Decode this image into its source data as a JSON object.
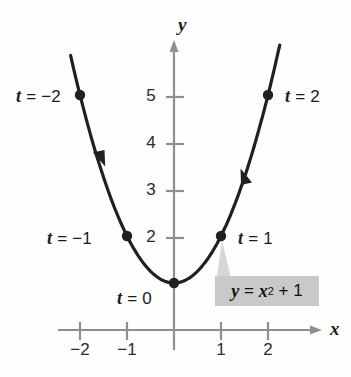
{
  "figure": {
    "background_color": "#fefefe",
    "curve_color": "#231f20",
    "axis_color": "#8a8a8a",
    "point_color": "#231f20",
    "equation_box_color": "#c9c9c9"
  },
  "axes": {
    "x_name": "x",
    "y_name": "y",
    "x_ticks": [
      "−2",
      "−1",
      "1",
      "2"
    ],
    "y_ticks": [
      "2",
      "3",
      "4",
      "5"
    ],
    "x_range": [
      -2.5,
      3.1
    ],
    "y_range": [
      -0.6,
      5.9
    ],
    "grid": false,
    "x_axis_arrow": true,
    "y_axis_arrow": true
  },
  "equation": {
    "lhs": "y",
    "equals": "=",
    "rhs_base": "x",
    "rhs_exponent": "2",
    "rhs_tail": "+ 1",
    "full_text": "y = x² + 1"
  },
  "point_labels": [
    {
      "name": "t-minus-2",
      "text_prefix": "t",
      "text_rest": " = −2",
      "x": 16,
      "y": 86
    },
    {
      "name": "t-minus-1",
      "text_prefix": "t",
      "text_rest": " = −1",
      "x": 47,
      "y": 228
    },
    {
      "name": "t-zero",
      "text_prefix": "t",
      "text_rest": " = 0",
      "x": 117,
      "y": 285
    },
    {
      "name": "t-one",
      "text_prefix": "t",
      "text_rest": " = 1",
      "x": 238,
      "y": 228
    },
    {
      "name": "t-two",
      "text_prefix": "t",
      "text_rest": " = 2",
      "x": 285,
      "y": 86
    }
  ],
  "chart_data": {
    "type": "line",
    "xlabel": "x",
    "ylabel": "y",
    "xlim": [
      -2.5,
      3.1
    ],
    "ylim": [
      -0.6,
      5.9
    ],
    "grid": false,
    "legend": "none",
    "function": "y = x^2 + 1",
    "parametrization": "x = t, y = t^2 + 1",
    "series": [
      {
        "name": "y = x^2 + 1",
        "x": [
          -2.2,
          -2.0,
          -1.5,
          -1.0,
          -0.5,
          0.0,
          0.5,
          1.0,
          1.5,
          2.0,
          2.25
        ],
        "y": [
          5.84,
          5.0,
          3.25,
          2.0,
          1.25,
          1.0,
          1.25,
          2.0,
          3.25,
          5.0,
          6.06
        ]
      }
    ],
    "marked_points": [
      {
        "t": -2,
        "x": -2,
        "y": 5,
        "label": "t = −2"
      },
      {
        "t": -1,
        "x": -1,
        "y": 2,
        "label": "t = −1"
      },
      {
        "t": 0,
        "x": 0,
        "y": 1,
        "label": "t = 0"
      },
      {
        "t": 1,
        "x": 1,
        "y": 2,
        "label": "t = 1"
      },
      {
        "t": 2,
        "x": 2,
        "y": 5,
        "label": "t = 2"
      }
    ],
    "direction_arrows": [
      {
        "at_x": -1.55,
        "at_y": 3.4,
        "direction": "toward increasing t (downward-right)"
      },
      {
        "at_x": 1.5,
        "at_y": 3.3,
        "direction": "toward increasing t (upward-right)"
      }
    ],
    "annotations": [
      {
        "text": "y = x² + 1",
        "type": "equation-callout",
        "points_to": {
          "x": 1,
          "y": 2
        }
      }
    ],
    "x_tick_values": [
      -2,
      -1,
      1,
      2
    ],
    "y_tick_values": [
      2,
      3,
      4,
      5
    ]
  }
}
